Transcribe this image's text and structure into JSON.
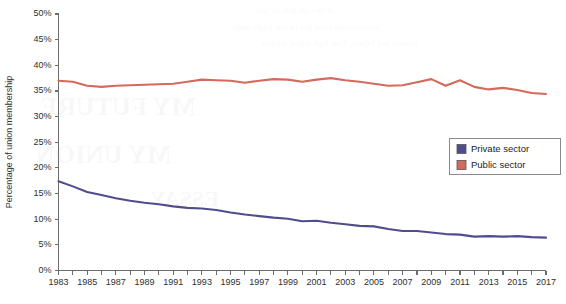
{
  "chart_data": {
    "type": "line",
    "title": "",
    "xlabel": "",
    "ylabel": "Percentage of union membership",
    "xlim": [
      1983,
      2017
    ],
    "ylim": [
      0,
      50
    ],
    "ytick_step": 5,
    "xtick_step": 1,
    "xlabel_step": 2,
    "grid": false,
    "legend_position": "center-right",
    "y_tick_labels": [
      "0%",
      "5%",
      "10%",
      "15%",
      "20%",
      "25%",
      "30%",
      "35%",
      "40%",
      "45%",
      "50%"
    ],
    "y_tick_values": [
      0,
      5,
      10,
      15,
      20,
      25,
      30,
      35,
      40,
      45,
      50
    ],
    "x_tick_values": [
      1983,
      1984,
      1985,
      1986,
      1987,
      1988,
      1989,
      1990,
      1991,
      1992,
      1993,
      1994,
      1995,
      1996,
      1997,
      1998,
      1999,
      2000,
      2001,
      2002,
      2003,
      2004,
      2005,
      2006,
      2007,
      2008,
      2009,
      2010,
      2011,
      2012,
      2013,
      2014,
      2015,
      2016,
      2017
    ],
    "x_tick_labels": [
      "1983",
      "",
      "1985",
      "",
      "1987",
      "",
      "1989",
      "",
      "1991",
      "",
      "1993",
      "",
      "1995",
      "",
      "1997",
      "",
      "1999",
      "",
      "2001",
      "",
      "2003",
      "",
      "2005",
      "",
      "2007",
      "",
      "2009",
      "",
      "2011",
      "",
      "2013",
      "",
      "2015",
      "",
      "2017"
    ],
    "x": [
      1983,
      1984,
      1985,
      1986,
      1987,
      1988,
      1989,
      1990,
      1991,
      1992,
      1993,
      1994,
      1995,
      1996,
      1997,
      1998,
      1999,
      2000,
      2001,
      2002,
      2003,
      2004,
      2005,
      2006,
      2007,
      2008,
      2009,
      2010,
      2011,
      2012,
      2013,
      2014,
      2015,
      2016,
      2017
    ],
    "series": [
      {
        "name": "Private sector",
        "color": "#4f4d8c",
        "values": [
          17.4,
          16.4,
          15.3,
          14.7,
          14.1,
          13.6,
          13.2,
          12.9,
          12.5,
          12.2,
          12.1,
          11.8,
          11.3,
          10.9,
          10.6,
          10.3,
          10.1,
          9.6,
          9.7,
          9.3,
          9.0,
          8.7,
          8.6,
          8.1,
          7.7,
          7.7,
          7.4,
          7.1,
          7.0,
          6.6,
          6.7,
          6.6,
          6.7,
          6.5,
          6.4
        ]
      },
      {
        "name": "Public sector",
        "color": "#d36a5b",
        "values": [
          37.0,
          36.8,
          36.0,
          35.8,
          36.0,
          36.1,
          36.2,
          36.3,
          36.4,
          36.8,
          37.2,
          37.1,
          37.0,
          36.6,
          37.0,
          37.3,
          37.2,
          36.8,
          37.2,
          37.5,
          37.1,
          36.8,
          36.4,
          36.0,
          36.1,
          36.7,
          37.3,
          36.0,
          37.1,
          35.8,
          35.3,
          35.6,
          35.2,
          34.6,
          34.4
        ]
      }
    ],
    "legend_entries": [
      {
        "label": "Private sector",
        "color": "#4f4d8c"
      },
      {
        "label": "Public sector",
        "color": "#d36a5b"
      }
    ]
  },
  "background_bleed": {
    "visible": true,
    "lines": [
      "of the right path for you.",
      "you, consider some key factors might make",
      "Interest and Talents, Your high school teaches",
      "MY FUTURE",
      "MY UNION",
      "ESSAY"
    ]
  }
}
